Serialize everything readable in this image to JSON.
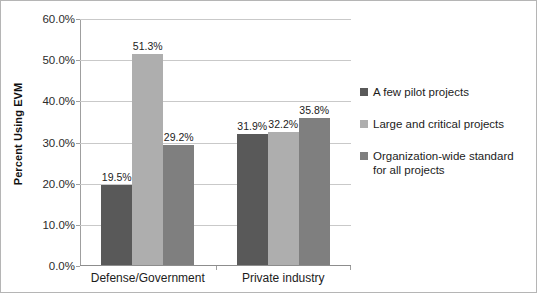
{
  "chart_data": {
    "type": "bar",
    "title": "",
    "xlabel": "",
    "ylabel": "Percent Using EVM",
    "categories": [
      "Defense/Government",
      "Private industry"
    ],
    "series": [
      {
        "name": "A few pilot projects",
        "color": "#595959",
        "values": [
          19.5,
          31.9
        ],
        "labels": [
          "19.5%",
          "31.9%"
        ]
      },
      {
        "name": "Large and critical projects",
        "color": "#aeaeae",
        "values": [
          51.3,
          32.2
        ],
        "labels": [
          "51.3%",
          "32.2%"
        ]
      },
      {
        "name": "Organization-wide standard for all projects",
        "name_line1": "Organization-wide standard",
        "name_line2": "for all projects",
        "color": "#7f7f7f",
        "values": [
          29.2,
          35.8
        ],
        "labels": [
          "29.2%",
          "35.8%"
        ]
      }
    ],
    "ylim": [
      0,
      60
    ],
    "y_ticks": [
      0,
      10,
      20,
      30,
      40,
      50,
      60
    ],
    "y_tick_labels": [
      "0.0%",
      "10.0%",
      "20.0%",
      "30.0%",
      "40.0%",
      "50.0%",
      "60.0%"
    ],
    "grid": true,
    "legend_position": "right"
  }
}
